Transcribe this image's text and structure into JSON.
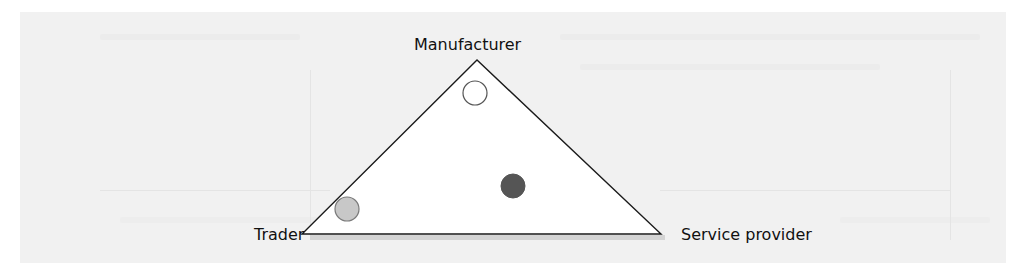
{
  "diagram": {
    "type": "triangle-positioning",
    "vertices": {
      "top": {
        "label": "Manufacturer",
        "x": 477,
        "y": 60
      },
      "bottom_left": {
        "label": "Trader",
        "x": 302,
        "y": 234
      },
      "bottom_right": {
        "label": "Service provider",
        "x": 661,
        "y": 234
      }
    },
    "markers": [
      {
        "name": "near-manufacturer",
        "cx": 475,
        "cy": 93,
        "r": 12,
        "fill": "#ffffff",
        "stroke": "#555555"
      },
      {
        "name": "interior-dark",
        "cx": 513,
        "cy": 186,
        "r": 12,
        "fill": "#555555",
        "stroke": "#555555"
      },
      {
        "name": "near-trader",
        "cx": 347,
        "cy": 209,
        "r": 12,
        "fill": "#c8c8c8",
        "stroke": "#777777"
      }
    ],
    "colors": {
      "page_background": "#ffffff",
      "scan_background": "#f1f1f1",
      "triangle_fill": "#ffffff",
      "triangle_stroke": "#1a1a1a",
      "label_text": "#111111",
      "base_shadow": "#cfcfcf"
    }
  }
}
